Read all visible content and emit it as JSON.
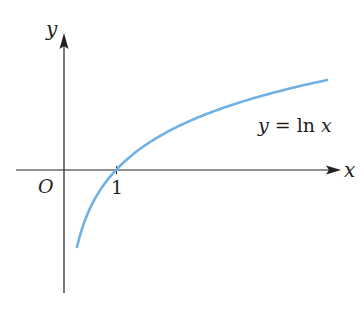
{
  "chart_data": {
    "type": "line",
    "title": "",
    "xlabel": "x",
    "ylabel": "y",
    "origin_label": "O",
    "x_ticks": [
      {
        "value": 1,
        "label": "1"
      }
    ],
    "series": [
      {
        "name": "y = ln x",
        "function": "ln(x)",
        "color": "#6fb1e4",
        "x": [
          0.25,
          0.35,
          0.5,
          0.75,
          1,
          1.5,
          2,
          2.5,
          3,
          3.5,
          4,
          4.5,
          5.06
        ],
        "values": [
          -1.386,
          -1.05,
          -0.693,
          -0.288,
          0,
          0.405,
          0.693,
          0.916,
          1.099,
          1.253,
          1.386,
          1.504,
          1.621
        ]
      }
    ],
    "annotations": [
      {
        "text": "y = ln x",
        "near": "right branch of curve, below it"
      }
    ],
    "xlim": [
      -0.9,
      5.3
    ],
    "ylim": [
      -2.2,
      2.4
    ],
    "grid": false,
    "legend": "none"
  },
  "labels": {
    "y_axis": "y",
    "x_axis": "x",
    "origin": "O",
    "tick_one": "1",
    "curve_label_y": "y",
    "curve_label_eq": " = ln ",
    "curve_label_x": "x"
  },
  "colors": {
    "axis": "#231f20",
    "curve": "#6fb1e4",
    "background": "#ffffff"
  }
}
